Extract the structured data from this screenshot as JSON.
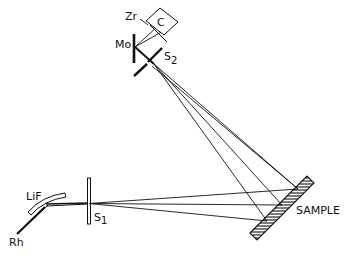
{
  "diagram": {
    "type": "x-ray spectrometer geometry",
    "labels": {
      "zr": "Zr",
      "c": "C",
      "mo": "Mo",
      "s2_main": "S",
      "s2_sub": "2",
      "lif": "LiF",
      "s1_main": "S",
      "s1_sub": "1",
      "rh": "Rh",
      "sample": "SAMPLE"
    },
    "components": [
      {
        "id": "rh-source",
        "label": "Rh"
      },
      {
        "id": "lif-crystal",
        "label": "LiF"
      },
      {
        "id": "slit-s1",
        "label": "S1"
      },
      {
        "id": "sample",
        "label": "SAMPLE"
      },
      {
        "id": "slit-s2",
        "label": "S2"
      },
      {
        "id": "mo-target",
        "label": "Mo"
      },
      {
        "id": "zr-filter",
        "label": "Zr"
      },
      {
        "id": "counter-c",
        "label": "C"
      }
    ],
    "colors": {
      "ink": "#111111",
      "background": "#ffffff"
    }
  }
}
